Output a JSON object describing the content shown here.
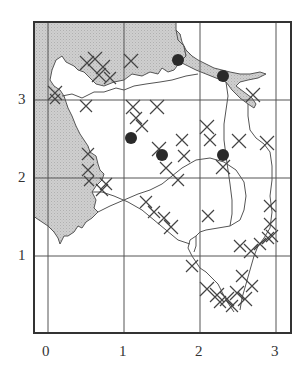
{
  "map": {
    "type": "grid-map",
    "colors": {
      "land_shaded": "#c9c9c9",
      "water": "#ffffff",
      "grid": "#555555",
      "frame": "#333333",
      "marker": "#2a2a2a",
      "cross": "#444444",
      "outline": "#555555"
    },
    "x_axis": {
      "ticks": [
        "0",
        "1",
        "2",
        "3"
      ]
    },
    "y_axis": {
      "ticks": [
        "1",
        "2",
        "3"
      ]
    },
    "grid": {
      "x_lines_px": [
        48,
        124,
        200,
        276
      ],
      "y_lines_px": [
        100,
        178,
        256
      ]
    },
    "legend": {
      "shaded": "land-area",
      "cross": "cross-hatched-cell",
      "dot": "point-marker"
    },
    "markers": [
      {
        "x": 1.73,
        "y": 3.45,
        "label": ""
      },
      {
        "x": 2.32,
        "y": 3.27,
        "label": ""
      },
      {
        "x": 1.09,
        "y": 2.51,
        "label": ""
      },
      {
        "x": 1.45,
        "y": 2.31,
        "label": ""
      },
      {
        "x": 2.29,
        "y": 2.29,
        "label": ""
      }
    ]
  }
}
